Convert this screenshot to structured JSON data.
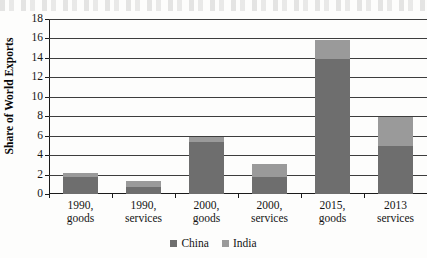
{
  "chart_data": {
    "type": "bar",
    "subtype": "stacked-vertical-bar",
    "title": "",
    "xlabel": "",
    "ylabel": "Share of World Exports",
    "ylim": [
      0,
      18
    ],
    "ytick_step": 2,
    "ytick_labels": [
      "18",
      "16",
      "14",
      "12",
      "10",
      "8",
      "6",
      "4",
      "2",
      "0"
    ],
    "ytick_values": [
      18,
      16,
      14,
      12,
      10,
      8,
      6,
      4,
      2,
      0
    ],
    "grid": true,
    "grid_orientation": "horizontal",
    "legend_position": "bottom-center",
    "categories": [
      {
        "line1": "1990,",
        "line2": "goods"
      },
      {
        "line1": "1990,",
        "line2": "services"
      },
      {
        "line1": "2000,",
        "line2": "goods"
      },
      {
        "line1": "2000,",
        "line2": "services"
      },
      {
        "line1": "2015,",
        "line2": "goods"
      },
      {
        "line1": "2013",
        "line2": "services"
      }
    ],
    "series": [
      {
        "name": "China",
        "color": "#6e6e6e",
        "values": [
          1.8,
          0.7,
          5.3,
          1.8,
          13.9,
          4.9
        ]
      },
      {
        "name": "India",
        "color": "#9a9a9a",
        "values": [
          0.4,
          0.6,
          0.6,
          1.3,
          1.9,
          3.0
        ]
      }
    ],
    "totals": [
      2.2,
      1.3,
      5.9,
      3.1,
      15.8,
      7.9
    ]
  },
  "legend": {
    "items": [
      {
        "label": "China",
        "color": "#6e6e6e"
      },
      {
        "label": "India",
        "color": "#9a9a9a"
      }
    ]
  }
}
